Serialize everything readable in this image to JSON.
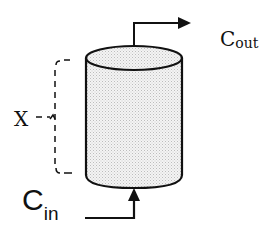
{
  "diagram": {
    "type": "column-reactor-schematic",
    "labels": {
      "c_out_main": "C",
      "c_out_sub": "out",
      "c_in_main": "C",
      "c_in_sub": "in",
      "x": "X"
    },
    "elements": {
      "column": "cylinder",
      "outlet_arrow": "arrow-right",
      "inlet_arrow": "arrow-up",
      "length_bracket": "dashed-bracket"
    },
    "colors": {
      "stroke": "#111111",
      "fill_pattern": "#d8d8d8",
      "background": "#ffffff"
    }
  }
}
